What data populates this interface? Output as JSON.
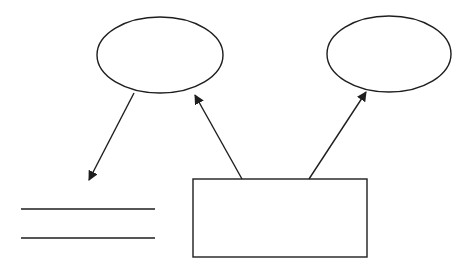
{
  "canvas": {
    "width": 471,
    "height": 269,
    "background": "#ffffff"
  },
  "style": {
    "stroke": "#1e1e1e",
    "stroke_width": 1.4
  },
  "nodes": [
    {
      "id": "ellipse-left",
      "shape": "ellipse",
      "cx": 160,
      "cy": 55,
      "rx": 63,
      "ry": 38,
      "label": ""
    },
    {
      "id": "ellipse-right",
      "shape": "ellipse",
      "cx": 389,
      "cy": 54,
      "rx": 62,
      "ry": 38,
      "label": ""
    },
    {
      "id": "box",
      "shape": "rect",
      "x": 193,
      "y": 179,
      "width": 174,
      "height": 78,
      "label": ""
    },
    {
      "id": "datastore",
      "shape": "parallel-lines",
      "x1": 21,
      "x2": 155,
      "y_top": 209,
      "y_bottom": 238,
      "label": ""
    }
  ],
  "edges": [
    {
      "id": "arrow-left-ellipse-to-datastore",
      "from": "ellipse-left",
      "to": "datastore",
      "x1": 134,
      "y1": 93,
      "x2": 89,
      "y2": 180
    },
    {
      "id": "arrow-box-to-left-ellipse",
      "from": "box",
      "to": "ellipse-left",
      "x1": 242,
      "y1": 179,
      "x2": 195,
      "y2": 95
    },
    {
      "id": "arrow-box-to-right-ellipse",
      "from": "box",
      "to": "ellipse-right",
      "x1": 309,
      "y1": 179,
      "x2": 366,
      "y2": 92
    }
  ]
}
